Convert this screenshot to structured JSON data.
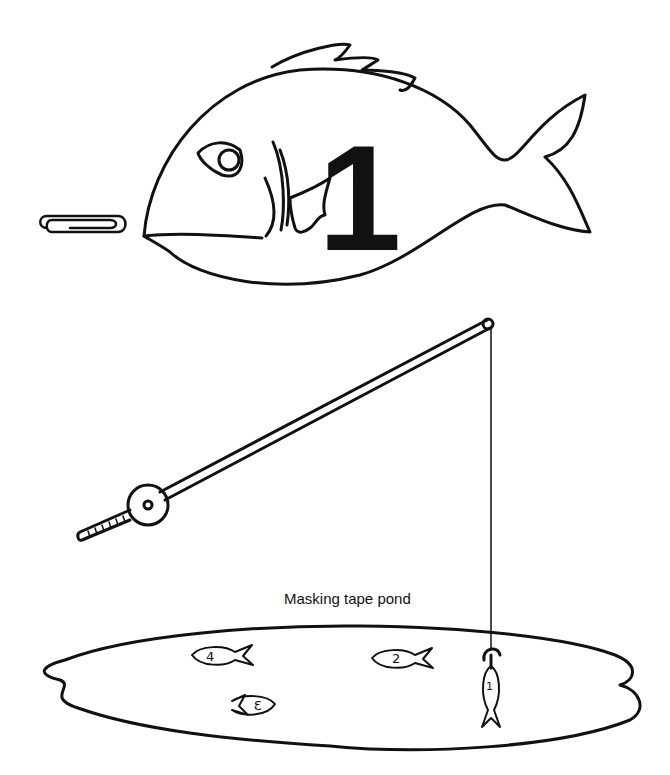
{
  "illustration": {
    "big_fish": {
      "number": "1"
    },
    "paperclip": {
      "label": "paperclip"
    },
    "fishing_rod": {
      "label": "fishing rod with magnet"
    },
    "pond": {
      "caption": "Masking tape pond",
      "fish": [
        {
          "number": "4"
        },
        {
          "number": "2"
        },
        {
          "number": "3"
        },
        {
          "number": "1",
          "hooked": true
        }
      ]
    },
    "colors": {
      "ink": "#111111",
      "paper": "#ffffff"
    }
  }
}
